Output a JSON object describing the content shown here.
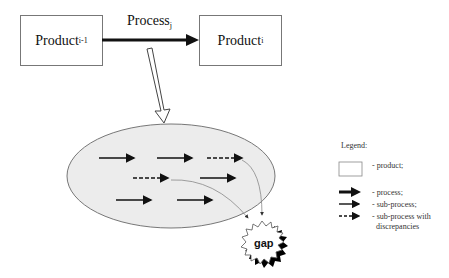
{
  "diagram": {
    "nodes": {
      "product_prev": {
        "base": "Product",
        "sub": "i-1"
      },
      "product_next": {
        "base": "Product",
        "sub": "i"
      },
      "process": {
        "base": "Process",
        "sub": "j"
      },
      "gap": "gap"
    },
    "legend": {
      "title": "Legend:",
      "items": [
        {
          "symbol": "box",
          "label": "- product;"
        },
        {
          "symbol": "thick-arrow",
          "label": "- process;"
        },
        {
          "symbol": "thin-arrow",
          "label": "- sub-process;"
        },
        {
          "symbol": "dashed-arrow",
          "label": "- sub-process with",
          "label2": "discrepancies"
        }
      ]
    },
    "colors": {
      "ellipse_fill": "#ececec",
      "ellipse_stroke": "#777777",
      "arrow": "#111111",
      "curve": "#888888",
      "gap_shadow": "#000000"
    }
  }
}
